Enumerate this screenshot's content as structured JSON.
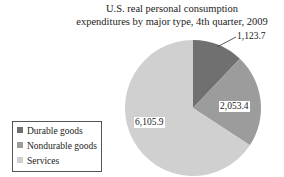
{
  "chart_data": {
    "type": "pie",
    "title": "U.S. real personal consumption expenditures by major type, 4th quarter, 2009",
    "title_lines": [
      "U.S. real personal consumption",
      "expenditures by major type, 4th quarter, 2009"
    ],
    "categories": [
      "Durable goods",
      "Nondurable goods",
      "Services"
    ],
    "values": [
      1123.7,
      2053.4,
      6105.9
    ],
    "value_labels": [
      "1,123.7",
      "2,053.4",
      "6,105.9"
    ],
    "colors": [
      "#707070",
      "#9c9c9c",
      "#d0d0d0"
    ],
    "legend_position": "bottom-left",
    "start_angle_deg": 90,
    "direction": "clockwise"
  }
}
